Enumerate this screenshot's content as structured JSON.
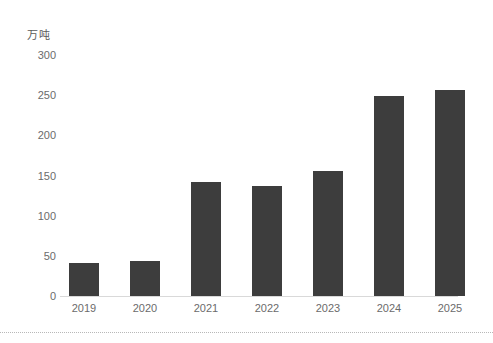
{
  "chart_data": {
    "type": "bar",
    "title": "",
    "subtitle": "",
    "unit_label": "万吨",
    "xlabel": "",
    "ylabel": "万吨",
    "categories": [
      "2019",
      "2020",
      "2021",
      "2022",
      "2023",
      "2024",
      "2025"
    ],
    "values": [
      41,
      43,
      142,
      137,
      155,
      249,
      257
    ],
    "series": [
      {
        "name": "产量",
        "values": [
          41,
          43,
          142,
          137,
          155,
          249,
          257
        ]
      }
    ],
    "ylim": [
      0,
      300
    ],
    "ytick_labels": [
      "300",
      "250",
      "200",
      "150",
      "100",
      "50",
      "0"
    ],
    "ytick_values": [
      300,
      250,
      200,
      150,
      100,
      50,
      0
    ],
    "grid": false,
    "legend": false,
    "legend_position": "none",
    "bar_color": "#3d3d3d",
    "axis_color": "#d9d9d9",
    "tick_text_color": "#6b6b6b",
    "background_color": "#ffffff"
  },
  "figure": {
    "divider_color": "#b8b8b8"
  }
}
